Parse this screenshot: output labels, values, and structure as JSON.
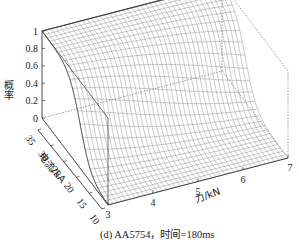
{
  "chart_data": {
    "type": "surface3d",
    "title": "",
    "caption": "(d) AA5754，时间=180ms",
    "xlabel": "力/kN",
    "ylabel": "电流/kA",
    "zlabel": "概率",
    "x_ticks": [
      3,
      4,
      5,
      6,
      7
    ],
    "y_ticks": [
      10,
      15,
      20,
      25,
      30,
      35
    ],
    "z_ticks": [
      0,
      0.2,
      0.4,
      0.6,
      0.8,
      1
    ],
    "x_range": [
      3,
      7
    ],
    "y_range": [
      10,
      35
    ],
    "z_range": [
      0,
      1
    ],
    "grid": false,
    "mesh": {
      "nx": 40,
      "ny": 26
    },
    "model": "probability = logistic sigmoid in current; high current (≈35 kA) → ~1, low current (≈10 kA) → ~0; transition shifts to higher current as force increases",
    "sample_points": [
      {
        "force": 3,
        "current": 35,
        "p": 1.0
      },
      {
        "force": 3,
        "current": 25,
        "p": 0.75
      },
      {
        "force": 3,
        "current": 20,
        "p": 0.3
      },
      {
        "force": 3,
        "current": 10,
        "p": 0.0
      },
      {
        "force": 7,
        "current": 35,
        "p": 1.0
      },
      {
        "force": 7,
        "current": 30,
        "p": 0.9
      },
      {
        "force": 7,
        "current": 25,
        "p": 0.25
      },
      {
        "force": 7,
        "current": 10,
        "p": 0.0
      }
    ],
    "colors": {
      "mesh": "#8a8a8a",
      "axis": "#333333",
      "box": "#555555"
    }
  }
}
